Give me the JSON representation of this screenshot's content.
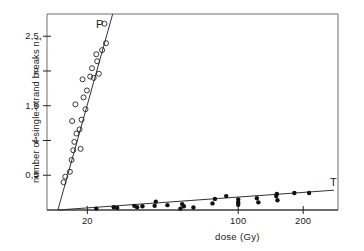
{
  "figure": {
    "axis_label_y": "number of single-strand breaks n",
    "axis_label_y_sub": "1",
    "axis_label_x": "dose (Gy)",
    "label_p": "P",
    "label_t": "T"
  },
  "chart_data": {
    "type": "scatter",
    "title": "",
    "xlabel": "dose (Gy)",
    "ylabel": "number of single-strand breaks n1",
    "xscale": "log",
    "yscale": "linear",
    "xlim": [
      13,
      290
    ],
    "ylim": [
      0,
      2.82
    ],
    "grid": false,
    "legend": "inline-labels",
    "xticks": [
      20,
      100,
      200
    ],
    "xticklabels": [
      "20",
      "100",
      "200"
    ],
    "yticks": [
      0.5,
      1,
      1.5,
      2,
      2.5
    ],
    "yticklabels": [
      "0,5",
      "1",
      "1,5",
      "2",
      "2,5"
    ],
    "series": [
      {
        "name": "P",
        "marker": "open-circle",
        "color": "#222222",
        "label_position": {
          "x": 96,
          "y": 18
        },
        "points": [
          {
            "x": 15.5,
            "y": 0.4
          },
          {
            "x": 15.8,
            "y": 0.48
          },
          {
            "x": 16.6,
            "y": 0.55
          },
          {
            "x": 16.9,
            "y": 0.72
          },
          {
            "x": 17.2,
            "y": 0.86
          },
          {
            "x": 18.6,
            "y": 0.88
          },
          {
            "x": 17.4,
            "y": 0.98
          },
          {
            "x": 17.8,
            "y": 1.1
          },
          {
            "x": 18.4,
            "y": 1.16
          },
          {
            "x": 17.0,
            "y": 1.28
          },
          {
            "x": 18.8,
            "y": 1.3
          },
          {
            "x": 19.6,
            "y": 1.45
          },
          {
            "x": 17.6,
            "y": 1.52
          },
          {
            "x": 19.2,
            "y": 1.62
          },
          {
            "x": 19.9,
            "y": 1.72
          },
          {
            "x": 19.0,
            "y": 1.88
          },
          {
            "x": 21.4,
            "y": 1.9
          },
          {
            "x": 20.6,
            "y": 1.92
          },
          {
            "x": 22.6,
            "y": 1.96
          },
          {
            "x": 21.0,
            "y": 2.04
          },
          {
            "x": 22.2,
            "y": 2.14
          },
          {
            "x": 22.0,
            "y": 2.24
          },
          {
            "x": 23.4,
            "y": 2.3
          },
          {
            "x": 24.4,
            "y": 2.4
          },
          {
            "x": 24.0,
            "y": 2.68
          }
        ],
        "fit_line": {
          "x1": 14.6,
          "y1": 0.0,
          "x2": 26.2,
          "y2": 2.82
        }
      },
      {
        "name": "T",
        "marker": "filled-circle",
        "color": "#111111",
        "label_position": {
          "x": 330,
          "y": 176
        },
        "points": [
          {
            "x": 22.0,
            "y": 0.02
          },
          {
            "x": 26.5,
            "y": 0.04
          },
          {
            "x": 27.5,
            "y": 0.03
          },
          {
            "x": 33.0,
            "y": 0.06
          },
          {
            "x": 34.0,
            "y": 0.04
          },
          {
            "x": 36.0,
            "y": 0.055
          },
          {
            "x": 41.0,
            "y": 0.06
          },
          {
            "x": 41.5,
            "y": 0.12
          },
          {
            "x": 47.0,
            "y": 0.07
          },
          {
            "x": 54.0,
            "y": 0.02
          },
          {
            "x": 55.0,
            "y": 0.085
          },
          {
            "x": 56.0,
            "y": 0.055
          },
          {
            "x": 62.0,
            "y": 0.035
          },
          {
            "x": 76.0,
            "y": 0.095
          },
          {
            "x": 78.0,
            "y": 0.16
          },
          {
            "x": 88.0,
            "y": 0.2
          },
          {
            "x": 100.0,
            "y": 0.11
          },
          {
            "x": 100.0,
            "y": 0.15
          },
          {
            "x": 100.0,
            "y": 0.075
          },
          {
            "x": 122.0,
            "y": 0.17
          },
          {
            "x": 124.0,
            "y": 0.11
          },
          {
            "x": 150.0,
            "y": 0.2
          },
          {
            "x": 151.0,
            "y": 0.23
          },
          {
            "x": 152.0,
            "y": 0.14
          },
          {
            "x": 182.0,
            "y": 0.245
          },
          {
            "x": 213.0,
            "y": 0.245
          }
        ],
        "fit_line": {
          "x1": 14.6,
          "y1": 0.0,
          "x2": 278.0,
          "y2": 0.285
        }
      }
    ]
  }
}
